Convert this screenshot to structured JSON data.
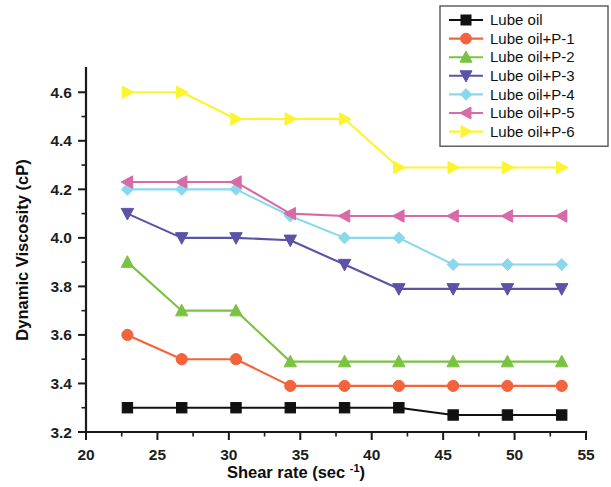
{
  "chart_data": {
    "type": "line",
    "title": "",
    "xlabel": "Shear rate (sec -1)",
    "xlabel_main": "Shear rate (sec ",
    "xlabel_sup": "-1",
    "xlabel_end": ")",
    "ylabel": "Dynamic Viscosity (cP)",
    "xlim": [
      20,
      55
    ],
    "ylim": [
      3.2,
      4.7
    ],
    "xticks": [
      20,
      25,
      30,
      35,
      40,
      45,
      50,
      55
    ],
    "yticks": [
      "3.2",
      "3.4",
      "3.6",
      "3.8",
      "4.0",
      "4.2",
      "4.4",
      "4.6"
    ],
    "ytick_values": [
      3.2,
      3.4,
      3.6,
      3.8,
      4.0,
      4.2,
      4.4,
      4.6
    ],
    "x_minor_ticks": [
      22.5,
      27.5,
      32.5,
      37.5,
      42.5,
      47.5,
      52.5
    ],
    "y_minor_ticks": [
      3.3,
      3.5,
      3.7,
      3.9,
      4.1,
      4.3,
      4.5
    ],
    "grid": false,
    "legend_position": "top-right",
    "x": [
      22.9,
      26.7,
      30.5,
      34.3,
      38.1,
      41.9,
      45.7,
      49.5,
      53.3
    ],
    "series": [
      {
        "name": "Lube oil",
        "color": "#111111",
        "marker": "square",
        "values": [
          3.3,
          3.3,
          3.3,
          3.3,
          3.3,
          3.3,
          3.27,
          3.27,
          3.27
        ]
      },
      {
        "name": "Lube oil+P-1",
        "color": "#f4633a",
        "marker": "circle",
        "values": [
          3.6,
          3.5,
          3.5,
          3.39,
          3.39,
          3.39,
          3.39,
          3.39,
          3.39
        ]
      },
      {
        "name": "Lube oil+P-2",
        "color": "#7cc242",
        "marker": "triangle-up",
        "values": [
          3.9,
          3.7,
          3.7,
          3.49,
          3.49,
          3.49,
          3.49,
          3.49,
          3.49
        ]
      },
      {
        "name": "Lube oil+P-3",
        "color": "#5b53a8",
        "marker": "triangle-down",
        "values": [
          4.1,
          4.0,
          4.0,
          3.99,
          3.89,
          3.79,
          3.79,
          3.79,
          3.79
        ]
      },
      {
        "name": "Lube oil+P-4",
        "color": "#88d8ee",
        "marker": "diamond",
        "values": [
          4.2,
          4.2,
          4.2,
          4.09,
          4.0,
          4.0,
          3.89,
          3.89,
          3.89
        ]
      },
      {
        "name": "Lube oil+P-5",
        "color": "#d96aa8",
        "marker": "triangle-left",
        "values": [
          4.23,
          4.23,
          4.23,
          4.1,
          4.09,
          4.09,
          4.09,
          4.09,
          4.09
        ]
      },
      {
        "name": "Lube oil+P-6",
        "color": "#fbf430",
        "marker": "triangle-right",
        "values": [
          4.6,
          4.6,
          4.49,
          4.49,
          4.49,
          4.29,
          4.29,
          4.29,
          4.29
        ]
      }
    ]
  }
}
